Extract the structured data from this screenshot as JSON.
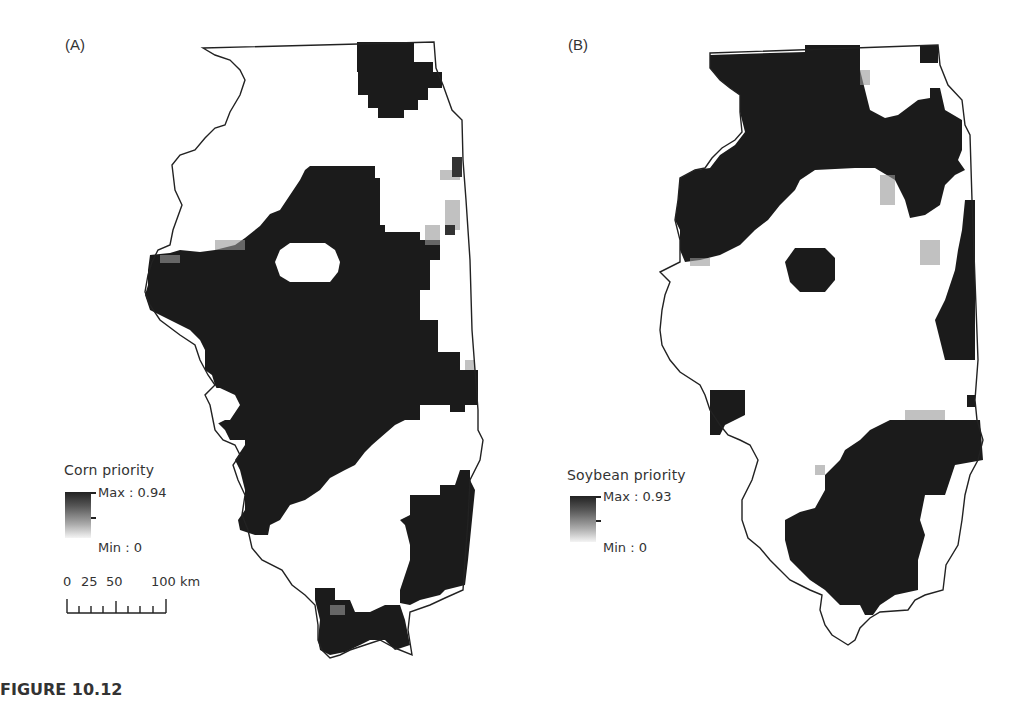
{
  "figure": {
    "caption": "FIGURE 10.12"
  },
  "panels": [
    {
      "label": "(A)",
      "legend": {
        "title": "Corn priority",
        "max_label": "Max : 0.94",
        "min_label": "Min : 0"
      },
      "scale_bar": {
        "labels": [
          "0",
          "25",
          "50",
          "100 km"
        ],
        "units": "km"
      }
    },
    {
      "label": "(B)",
      "legend": {
        "title": "Soybean priority",
        "max_label": "Max : 0.93",
        "min_label": "Min : 0"
      }
    }
  ],
  "colors": {
    "high": "#1a1a1a",
    "low": "#ffffff",
    "outline": "#222222"
  }
}
